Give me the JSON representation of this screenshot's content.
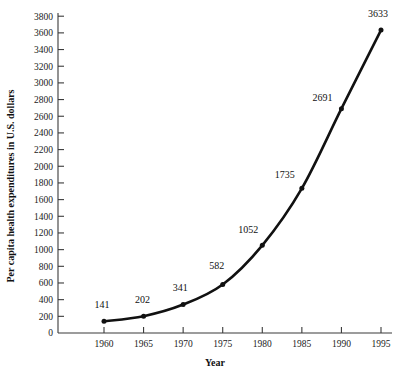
{
  "chart_data": {
    "type": "line",
    "title": "",
    "xlabel": "Year",
    "ylabel": "Per capita health expenditures in U.S. dollars",
    "x": [
      1960,
      1965,
      1970,
      1975,
      1980,
      1985,
      1990,
      1995
    ],
    "values": [
      141,
      202,
      341,
      582,
      1052,
      1735,
      2691,
      3633
    ],
    "point_labels": [
      "141",
      "202",
      "341",
      "582",
      "1052",
      "1735",
      "2691",
      "3633"
    ],
    "xlim": [
      1960,
      1995
    ],
    "ylim": [
      0,
      3800
    ],
    "xticks": [
      1960,
      1965,
      1970,
      1975,
      1980,
      1985,
      1990,
      1995
    ],
    "xtick_labels": [
      "1960",
      "1965",
      "1970",
      "1975",
      "1980",
      "1985",
      "1990",
      "1995"
    ],
    "yticks": [
      0,
      200,
      400,
      600,
      800,
      1000,
      1200,
      1400,
      1600,
      1800,
      2000,
      2200,
      2400,
      2600,
      2800,
      3000,
      3200,
      3400,
      3600,
      3800
    ],
    "ytick_labels": [
      "0",
      "200",
      "400",
      "600",
      "800",
      "1000",
      "1200",
      "1400",
      "1600",
      "1800",
      "2000",
      "2200",
      "2400",
      "2600",
      "2800",
      "3000",
      "3200",
      "3400",
      "3600",
      "3800"
    ],
    "grid": false,
    "legend": null,
    "series_color": "#111111",
    "axis_color": "#3a3a3a",
    "background_color": "#ffffff"
  }
}
